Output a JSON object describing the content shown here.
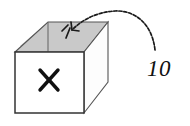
{
  "figure": {
    "background_color": "#ffffff"
  },
  "box": {
    "name": "open-box",
    "front_face_label": "X",
    "colors": {
      "top_face": "#c9c9c9",
      "inner_wall": "#bdbdbd",
      "front_face": "#ffffff",
      "right_face": "#fdfdfd",
      "outline": "#333333",
      "mark": "#111111"
    }
  },
  "annotation": {
    "arrow_name": "curved-arrow-into-box",
    "arrow_color": "#1a1a1a",
    "arrow_style": "dashed-curved",
    "arrow_direction": "right-to-left-into-box-opening",
    "label": "10"
  }
}
